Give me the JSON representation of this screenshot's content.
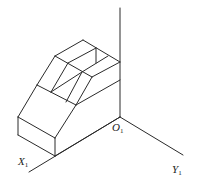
{
  "figure": {
    "type": "isometric axonometric drawing",
    "axes": {
      "origin_label": "O",
      "origin_sub": "1",
      "x_label": "X",
      "x_sub": "1",
      "y_label": "Y",
      "y_sub": "1"
    },
    "colors": {
      "line": "#2a2a2a",
      "background": "#ffffff"
    }
  }
}
